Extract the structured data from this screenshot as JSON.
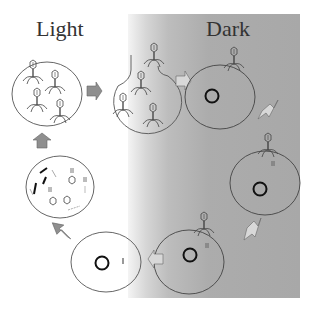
{
  "labels": {
    "light": "Light",
    "dark": "Dark"
  },
  "colors": {
    "dark_region": "#a8a8a8",
    "arrow_fill": "#8f8f8f",
    "arrow_fill_light": "#d8d8d8",
    "outline": "#444444",
    "genome_ring": "#111111"
  },
  "stages": [
    {
      "id": "released-phages",
      "description": "Lysed cell releasing phage particles",
      "phage_count": 4
    },
    {
      "id": "infecting-cell",
      "description": "Cell with phages bursting out, one phage attached above",
      "phage_count": 4
    },
    {
      "id": "dark-cell-1",
      "description": "Host cell with genome ring, phage adsorbing",
      "phage_count": 1
    },
    {
      "id": "dark-cell-2",
      "description": "Host cell with genome ring and injected phage DNA",
      "phage_count": 1
    },
    {
      "id": "dark-cell-3",
      "description": "Host cell with genome ring and phage DNA",
      "phage_count": 1
    },
    {
      "id": "light-cell",
      "description": "Host cell with genome ring and phage DNA fragment"
    },
    {
      "id": "assembly-cell",
      "description": "Cell with phage components being assembled (tails, heads, DNA)"
    }
  ]
}
